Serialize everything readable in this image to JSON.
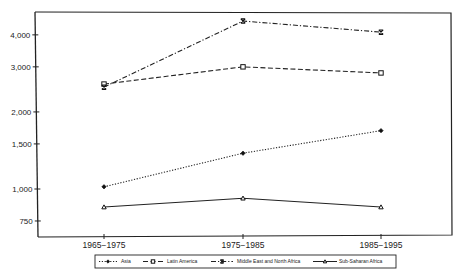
{
  "chart_data": {
    "type": "line",
    "title": "",
    "xlabel": "",
    "ylabel": "",
    "y_scale": "log",
    "ylim": [
      650,
      4800
    ],
    "y_ticks": [
      750,
      1000,
      1500,
      2000,
      3000,
      4000
    ],
    "y_tick_labels": [
      "750",
      "1,000",
      "1,500",
      "2,000",
      "3,000",
      "4,000"
    ],
    "categories": [
      "1965−1975",
      "1975−1985",
      "1985−1995"
    ],
    "grid": false,
    "legend_position": "bottom",
    "series": [
      {
        "name": "Asia",
        "style": "dotted",
        "marker": "diamond-filled",
        "values": [
          1020,
          1380,
          1690
        ]
      },
      {
        "name": "Latin America",
        "style": "dashed",
        "marker": "square-open",
        "values": [
          2570,
          3000,
          2840
        ]
      },
      {
        "name": "Middle East and North Africa",
        "style": "dash-dot",
        "marker": "x-bar",
        "values": [
          2500,
          4530,
          4100
        ]
      },
      {
        "name": "Sub-Saharan Africa",
        "style": "solid",
        "marker": "triangle-open",
        "values": [
          850,
          920,
          850
        ]
      }
    ]
  },
  "legend": {
    "items": [
      {
        "label": "Asia"
      },
      {
        "label": "Latin America"
      },
      {
        "label": "Middle East and North Africa"
      },
      {
        "label": "Sub-Saharan Africa"
      }
    ]
  }
}
